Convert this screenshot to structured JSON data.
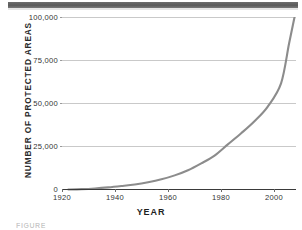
{
  "figure": {
    "caption_partial": "FIGURE"
  },
  "chart_data": {
    "type": "line",
    "title": "",
    "xlabel": "YEAR",
    "ylabel": "NUMBER OF PROTECTED AREAS",
    "xlim": [
      1918,
      2006
    ],
    "ylim": [
      0,
      100000
    ],
    "grid": true,
    "legend": "none",
    "line_color": "#8c8c8c",
    "axis_color": "#3a3a3a",
    "grid_color": "#c9c9c9",
    "xticks": [
      1920,
      1940,
      1960,
      1980,
      2000
    ],
    "xtick_labels": [
      "1920",
      "1940",
      "1960",
      "1980",
      "2000"
    ],
    "yticks": [
      0,
      25000,
      50000,
      75000,
      100000
    ],
    "ytick_labels": [
      "0",
      "25,000",
      "50,000",
      "75,000",
      "100,000"
    ],
    "x": [
      1920,
      1925,
      1930,
      1935,
      1940,
      1945,
      1950,
      1955,
      1960,
      1965,
      1970,
      1975,
      1980,
      1985,
      1990,
      1995,
      2000,
      2003,
      2005
    ],
    "values": [
      300,
      500,
      900,
      1500,
      2300,
      3200,
      4500,
      6200,
      8500,
      11500,
      15500,
      20000,
      26500,
      33000,
      40000,
      48500,
      62000,
      85000,
      100000
    ]
  }
}
